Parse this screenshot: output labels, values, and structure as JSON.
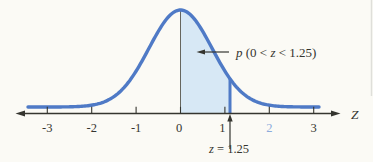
{
  "figure": {
    "background": "#fbfaf5",
    "curve_color": "#4f7ac6",
    "fill_color": "#d7e8f5",
    "ink_color": "#35352f",
    "zero_line_color": "#66665e",
    "edge_artifact_color": "#c9c9c4"
  },
  "chart_data": {
    "type": "area",
    "title": "",
    "xlabel": "Z",
    "x_ticks": [
      -3,
      -2,
      -1,
      0,
      1,
      2,
      3
    ],
    "tick_labels": [
      {
        "label": "-3",
        "color": "#35352f"
      },
      {
        "label": "-2",
        "color": "#35352f"
      },
      {
        "label": "-1",
        "color": "#35352f"
      },
      {
        "label": "0",
        "color": "#35352f"
      },
      {
        "label": "1",
        "color": "#35352f"
      },
      {
        "label": "2",
        "color": "#8cabdc"
      },
      {
        "label": "3",
        "color": "#35352f"
      }
    ],
    "xlim": [
      -3.4,
      3.4
    ],
    "grid": false,
    "curve": {
      "distribution": "standard-normal",
      "mean": 0,
      "sd": 1
    },
    "shaded_region": {
      "from_z": 0,
      "to_z": 1.25
    },
    "annotations": [
      {
        "id": "area-probability-label",
        "text": "p (0 < z < 1.25)",
        "parts": [
          {
            "t": "p",
            "italic": true
          },
          {
            "t": " (0 < ",
            "italic": false
          },
          {
            "t": "z",
            "italic": true
          },
          {
            "t": " < 1.25)",
            "italic": false
          }
        ]
      },
      {
        "id": "cutoff-label",
        "text": "z = 1.25",
        "parts": [
          {
            "t": "z",
            "italic": true
          },
          {
            "t": " = 1.25",
            "italic": false
          }
        ]
      }
    ]
  }
}
